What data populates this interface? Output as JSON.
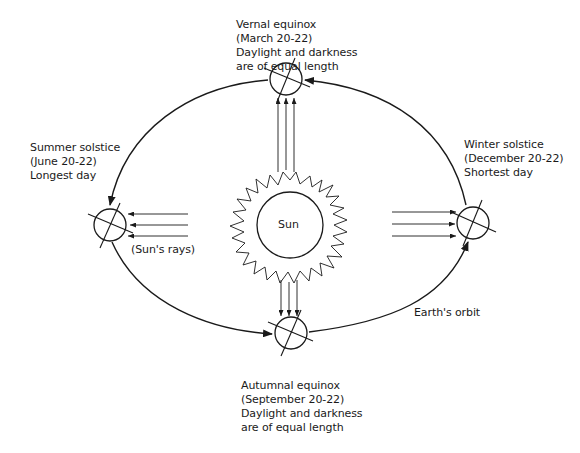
{
  "diagram": {
    "sun_label": "Sun",
    "rays_label": "(Sun's rays)",
    "orbit_label": "Earth's orbit",
    "positions": [
      {
        "id": "vernal-equinox",
        "lines": [
          "Vernal equinox",
          "(March 20-22)",
          "Daylight and darkness",
          "are of equal length"
        ]
      },
      {
        "id": "summer-solstice",
        "lines": [
          "Summer solstice",
          "(June 20-22)",
          "Longest day"
        ]
      },
      {
        "id": "winter-solstice",
        "lines": [
          "Winter solstice",
          "(December 20-22)",
          "Shortest day"
        ]
      },
      {
        "id": "autumnal-equinox",
        "lines": [
          "Autumnal equinox",
          "(September 20-22)",
          "Daylight and darkness",
          "are of equal length"
        ]
      }
    ],
    "colors": {
      "line": "#1a1a1a",
      "background": "#ffffff"
    }
  }
}
